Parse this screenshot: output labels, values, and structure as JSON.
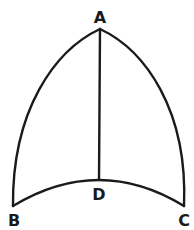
{
  "diagram": {
    "type": "geometric-figure",
    "stroke_color": "#1a1a1a",
    "background": "#ffffff",
    "points": {
      "A": {
        "label": "A",
        "x": 100,
        "y": 29
      },
      "B": {
        "label": "B",
        "x": 13,
        "y": 206
      },
      "C": {
        "label": "C",
        "x": 184,
        "y": 206
      },
      "D": {
        "label": "D",
        "x": 99,
        "y": 180
      }
    },
    "labels": {
      "A": "A",
      "B": "B",
      "C": "C",
      "D": "D"
    },
    "edges": [
      {
        "from": "A",
        "to": "B",
        "kind": "arc"
      },
      {
        "from": "A",
        "to": "C",
        "kind": "arc"
      },
      {
        "from": "B",
        "to": "C",
        "kind": "arc",
        "through": "D"
      },
      {
        "from": "A",
        "to": "D",
        "kind": "line"
      }
    ]
  }
}
